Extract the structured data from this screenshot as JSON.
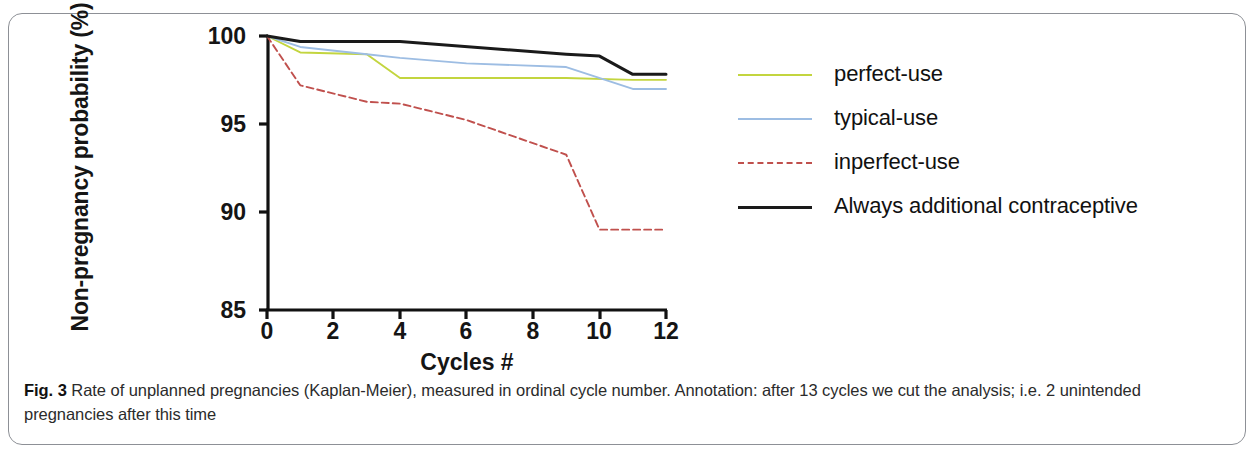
{
  "figure": {
    "label": "Fig. 3",
    "caption": " Rate of unplanned pregnancies (Kaplan-Meier), measured in ordinal cycle number. Annotation: after 13 cycles we cut the analysis; i.e. 2 unintended pregnancies after this time"
  },
  "colors": {
    "perfect_use": "#c3d53f",
    "typical_use": "#9dbde3",
    "inperfect_use": "#c0504d",
    "always_additional": "#1a1a1a",
    "axis": "#111111",
    "frame": "#8d9096"
  },
  "legend": {
    "items": [
      {
        "label": "perfect-use",
        "color": "#c3d53f",
        "style": "solid"
      },
      {
        "label": "typical-use",
        "color": "#9dbde3",
        "style": "solid"
      },
      {
        "label": "inperfect-use",
        "color": "#c0504d",
        "style": "dashed"
      },
      {
        "label": "Always additional contraceptive",
        "color": "#1a1a1a",
        "style": "solid"
      }
    ]
  },
  "chart_data": {
    "type": "line",
    "title": "",
    "xlabel": "Cycles #",
    "ylabel": "Non-pregnancy probability (%)",
    "xlim": [
      0,
      12
    ],
    "ylim": [
      85,
      100
    ],
    "xticks": [
      0,
      2,
      4,
      6,
      8,
      10,
      12
    ],
    "yticks": [
      85,
      90,
      95,
      100
    ],
    "grid": false,
    "legend_position": "right",
    "annotation": "after 13 cycles we cut the analysis; i.e. 2 unintended pregnancies after this time",
    "series": [
      {
        "name": "perfect-use",
        "color": "#c3d53f",
        "style": "solid",
        "x": [
          0,
          1,
          3,
          4,
          9,
          11,
          12
        ],
        "values": [
          100,
          99.1,
          99.0,
          97.7,
          97.7,
          97.6,
          97.6
        ]
      },
      {
        "name": "typical-use",
        "color": "#9dbde3",
        "style": "solid",
        "x": [
          0,
          1,
          3,
          4,
          6,
          9,
          11,
          12
        ],
        "values": [
          100,
          99.4,
          99.0,
          98.8,
          98.5,
          98.3,
          97.1,
          97.1
        ]
      },
      {
        "name": "inperfect-use",
        "color": "#c0504d",
        "style": "dashed",
        "x": [
          0,
          1,
          3,
          4,
          6,
          9,
          10,
          12
        ],
        "values": [
          100,
          97.3,
          96.4,
          96.3,
          95.4,
          93.5,
          89.4,
          89.4
        ]
      },
      {
        "name": "Always additional contraceptive",
        "color": "#1a1a1a",
        "style": "solid",
        "x": [
          0,
          1,
          4,
          9,
          10,
          11,
          12
        ],
        "values": [
          100,
          99.7,
          99.7,
          99.0,
          98.9,
          97.9,
          97.9
        ]
      }
    ]
  },
  "axes": {
    "y_tick_labels": [
      "100",
      "95",
      "90",
      "85"
    ],
    "x_tick_labels": [
      "0",
      "2",
      "4",
      "6",
      "8",
      "10",
      "12"
    ]
  }
}
